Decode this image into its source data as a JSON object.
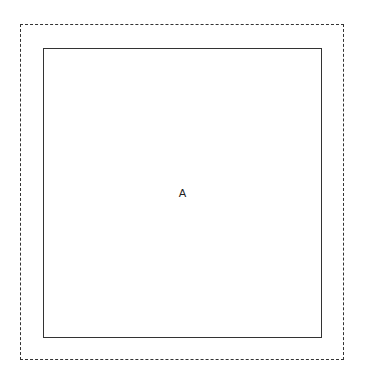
{
  "diagram": {
    "outer_box": {
      "style": "dashed"
    },
    "inner_box": {
      "style": "solid",
      "label": "A"
    }
  }
}
